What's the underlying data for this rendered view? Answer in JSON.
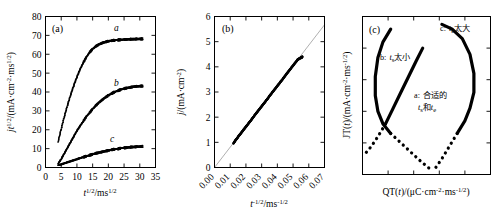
{
  "figure": {
    "panels": [
      {
        "tag": "(a)",
        "xlabel": {
          "base": "t",
          "sup": "1/2",
          "unit_base": "ms",
          "unit_sup": "1/2"
        },
        "ylabel": {
          "text": "jt",
          "sup": "1/2",
          "unit": "/(mA·cm",
          "unit_sup": "-2",
          "unit_mid": "·ms",
          "unit_sup2": "1/2",
          ",close": ")"
        },
        "xticks": [
          "0",
          "5",
          "10",
          "15",
          "20",
          "25",
          "30",
          "35"
        ],
        "yticks": [
          "0",
          "10",
          "20",
          "30",
          "40",
          "50",
          "60",
          "70",
          "80"
        ],
        "curve_labels": [
          "a",
          "b",
          "c"
        ]
      },
      {
        "tag": "(b)",
        "xlabel": {
          "base": "t",
          "sup": "-1/2",
          "unit_base": "ms",
          "unit_sup": "-1/2"
        },
        "ylabel": {
          "text": "j",
          "unit": "/(mA·cm",
          "unit_sup": "-2",
          "close": ")"
        },
        "xticks": [
          "0.00",
          "0.01",
          "0.02",
          "0.03",
          "0.04",
          "0.05",
          "0.06",
          "0.07"
        ],
        "yticks": [
          "0",
          "1",
          "2",
          "3",
          "4",
          "5",
          "6"
        ]
      },
      {
        "tag": "(c)",
        "xlabel": {
          "text": "QT(t)/(μC·cm",
          "sup": "-2",
          "mid": "·ms",
          "sup2": "-1/2",
          "close": ")"
        },
        "ylabel": {
          "text": "JT(t)/(mA·cm",
          "sup": "-2",
          "mid": "·ms",
          "sup2": "-1/2",
          "close": ")"
        },
        "annotations": [
          {
            "id": "b",
            "prefix": "b:",
            "sym": "t",
            "sub": "s",
            "text": "太小"
          },
          {
            "id": "c",
            "prefix": "c:",
            "sym": "t",
            "sub": "e",
            "text": "太大"
          },
          {
            "id": "a",
            "prefix": "a:",
            "line1": "合适的",
            "sym1": "t",
            "sub1": "s",
            "mid": "和",
            "sym2": "t",
            "sub2": "e"
          }
        ]
      }
    ]
  },
  "chart_data": [
    {
      "type": "scatter",
      "panel": "(a)",
      "title": "",
      "xlabel": "t^(1/2)/ms^(1/2)",
      "ylabel": "jt^(1/2)/(mA·cm^-2·ms^(1/2))",
      "xlim": [
        0,
        35
      ],
      "ylim": [
        0,
        80
      ],
      "xticks": [
        0,
        5,
        10,
        15,
        20,
        25,
        30,
        35
      ],
      "yticks": [
        0,
        10,
        20,
        30,
        40,
        50,
        60,
        70,
        80
      ],
      "grid": false,
      "legend": "inline-curve-labels",
      "series": [
        {
          "name": "a",
          "x": [
            4,
            5,
            6,
            7,
            8,
            9,
            10,
            11,
            12,
            13,
            14,
            15,
            16,
            17,
            18,
            19,
            20,
            21,
            22,
            23,
            24,
            25,
            26,
            27,
            28,
            29,
            30,
            31
          ],
          "y": [
            13.5,
            20.5,
            27.0,
            33.0,
            38.5,
            43.5,
            48.0,
            52.0,
            55.5,
            58.5,
            61.0,
            62.8,
            64.2,
            65.2,
            66.0,
            66.5,
            66.9,
            67.2,
            67.4,
            67.6,
            67.7,
            67.8,
            67.9,
            68.0,
            68.0,
            68.1,
            68.1,
            68.2
          ]
        },
        {
          "name": "b",
          "x": [
            4,
            5,
            6,
            7,
            8,
            9,
            10,
            11,
            12,
            13,
            14,
            15,
            16,
            17,
            18,
            19,
            20,
            21,
            22,
            23,
            24,
            25,
            26,
            27,
            28,
            29,
            30,
            31
          ],
          "y": [
            2.0,
            4.5,
            7.5,
            10.5,
            13.5,
            16.5,
            19.5,
            22.0,
            24.5,
            27.0,
            29.0,
            31.0,
            32.8,
            34.4,
            35.8,
            37.1,
            38.2,
            39.2,
            40.0,
            40.7,
            41.3,
            41.8,
            42.2,
            42.5,
            42.8,
            43.0,
            43.1,
            43.2
          ]
        },
        {
          "name": "c",
          "x": [
            4,
            5,
            6,
            7,
            8,
            9,
            10,
            11,
            12,
            13,
            14,
            15,
            16,
            17,
            18,
            19,
            20,
            21,
            22,
            23,
            24,
            25,
            26,
            27,
            28,
            29,
            30,
            31
          ],
          "y": [
            1.2,
            1.7,
            2.2,
            2.8,
            3.3,
            3.9,
            4.4,
            5.0,
            5.5,
            6.0,
            6.5,
            7.0,
            7.5,
            7.9,
            8.3,
            8.7,
            9.0,
            9.4,
            9.7,
            9.9,
            10.2,
            10.4,
            10.6,
            10.8,
            10.9,
            11.0,
            11.1,
            11.2
          ]
        }
      ]
    },
    {
      "type": "scatter",
      "panel": "(b)",
      "title": "",
      "xlabel": "t^(-1/2)/ms^(-1/2)",
      "ylabel": "j/(mA·cm^-2)",
      "xlim": [
        0,
        0.07
      ],
      "ylim": [
        0,
        6
      ],
      "xticks": [
        0.0,
        0.01,
        0.02,
        0.03,
        0.04,
        0.05,
        0.06,
        0.07
      ],
      "yticks": [
        0,
        1,
        2,
        3,
        4,
        5,
        6
      ],
      "grid": false,
      "fit_line": {
        "slope": 81.0,
        "intercept": 0.0,
        "color": "#9a9a9a"
      },
      "series": [
        {
          "name": "j vs t^-1/2",
          "x": [
            0.012,
            0.0128,
            0.0136,
            0.0145,
            0.0154,
            0.0163,
            0.0172,
            0.0181,
            0.019,
            0.02,
            0.021,
            0.022,
            0.023,
            0.024,
            0.025,
            0.026,
            0.027,
            0.028,
            0.029,
            0.03,
            0.031,
            0.032,
            0.033,
            0.034,
            0.035,
            0.036,
            0.037,
            0.038,
            0.039,
            0.04,
            0.041,
            0.042,
            0.043,
            0.044,
            0.045,
            0.046,
            0.047,
            0.048,
            0.049,
            0.05,
            0.051,
            0.052,
            0.053,
            0.054,
            0.055,
            0.0555,
            0.056
          ],
          "y": [
            0.95,
            1.03,
            1.1,
            1.17,
            1.25,
            1.32,
            1.39,
            1.47,
            1.54,
            1.62,
            1.7,
            1.78,
            1.86,
            1.94,
            2.03,
            2.11,
            2.19,
            2.27,
            2.35,
            2.43,
            2.51,
            2.59,
            2.67,
            2.75,
            2.84,
            2.92,
            3.0,
            3.08,
            3.16,
            3.24,
            3.32,
            3.4,
            3.48,
            3.56,
            3.65,
            3.73,
            3.81,
            3.89,
            3.97,
            4.05,
            4.13,
            4.21,
            4.29,
            4.33,
            4.36,
            4.38,
            4.4
          ]
        }
      ]
    },
    {
      "type": "line",
      "panel": "(c)",
      "title": "",
      "xlabel": "QT(t)/(μC·cm^-2·ms^-1/2)",
      "ylabel": "JT(t)/(mA·cm^-2·ms^-1/2)",
      "xlim": [
        0,
        1
      ],
      "ylim": [
        0,
        1
      ],
      "xticks": [],
      "yticks": [],
      "grid": false,
      "note": "Schematic Q-J plot; axes unlabeled numerically",
      "series": [
        {
          "name": "b: t_s too small",
          "style": "solid-then-dotted",
          "x": [
            0.22,
            0.16,
            0.12,
            0.1,
            0.1,
            0.12,
            0.16,
            0.22,
            0.3,
            0.38,
            0.46,
            0.55
          ],
          "y": [
            0.92,
            0.84,
            0.74,
            0.62,
            0.5,
            0.4,
            0.32,
            0.26,
            0.2,
            0.14,
            0.08,
            0.02
          ]
        },
        {
          "name": "a: suitable t_s and t_e",
          "style": "solid-then-dotted",
          "x": [
            0.47,
            0.42,
            0.36,
            0.3,
            0.24,
            0.18,
            0.12,
            0.07,
            0.03
          ],
          "y": [
            0.8,
            0.72,
            0.62,
            0.52,
            0.42,
            0.32,
            0.24,
            0.18,
            0.14
          ]
        },
        {
          "name": "c: t_e too large",
          "style": "solid-then-dotted",
          "x": [
            0.62,
            0.7,
            0.78,
            0.84,
            0.87,
            0.87,
            0.84,
            0.8,
            0.74,
            0.68,
            0.62,
            0.56
          ],
          "y": [
            0.95,
            0.92,
            0.86,
            0.76,
            0.64,
            0.52,
            0.42,
            0.34,
            0.26,
            0.18,
            0.1,
            0.03
          ]
        }
      ]
    }
  ]
}
